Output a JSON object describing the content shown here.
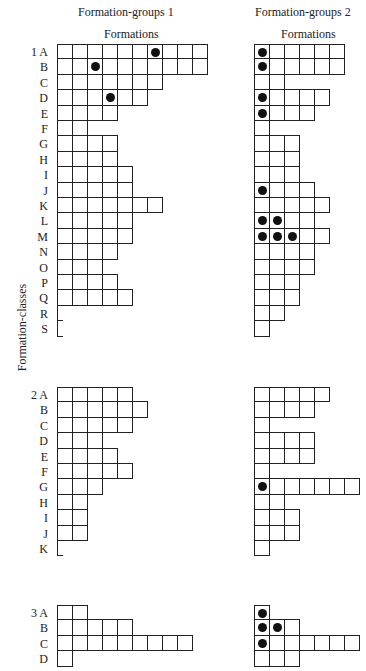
{
  "headers": {
    "group1": "Formation-groups 1",
    "group2": "Formation-groups 2",
    "sub1": "Formations",
    "sub2": "Formations",
    "yaxis": "Formation-classes"
  },
  "classes": [
    {
      "label": "1",
      "top": 44,
      "rows": [
        {
          "letter": "A",
          "g1": 10,
          "g1dots": [
            7
          ],
          "g2": 6,
          "g2dots": [
            1
          ]
        },
        {
          "letter": "B",
          "g1": 10,
          "g1dots": [
            3
          ],
          "g2": 6,
          "g2dots": [
            1
          ]
        },
        {
          "letter": "C",
          "g1": 7,
          "g1dots": [],
          "g2": 2,
          "g2dots": []
        },
        {
          "letter": "D",
          "g1": 6,
          "g1dots": [
            4
          ],
          "g2": 5,
          "g2dots": [
            1
          ]
        },
        {
          "letter": "E",
          "g1": 4,
          "g1dots": [],
          "g2": 4,
          "g2dots": [
            1
          ]
        },
        {
          "letter": "F",
          "g1": 2,
          "g1dots": [],
          "g2": 1,
          "g2dots": []
        },
        {
          "letter": "G",
          "g1": 4,
          "g1dots": [],
          "g2": 3,
          "g2dots": []
        },
        {
          "letter": "H",
          "g1": 4,
          "g1dots": [],
          "g2": 3,
          "g2dots": []
        },
        {
          "letter": "I",
          "g1": 5,
          "g1dots": [],
          "g2": 3,
          "g2dots": []
        },
        {
          "letter": "J",
          "g1": 5,
          "g1dots": [],
          "g2": 4,
          "g2dots": [
            1
          ]
        },
        {
          "letter": "K",
          "g1": 7,
          "g1dots": [],
          "g2": 5,
          "g2dots": []
        },
        {
          "letter": "L",
          "g1": 5,
          "g1dots": [],
          "g2": 4,
          "g2dots": [
            1,
            2
          ]
        },
        {
          "letter": "M",
          "g1": 5,
          "g1dots": [],
          "g2": 5,
          "g2dots": [
            1,
            2,
            3
          ]
        },
        {
          "letter": "N",
          "g1": 4,
          "g1dots": [],
          "g2": 4,
          "g2dots": []
        },
        {
          "letter": "O",
          "g1": 3,
          "g1dots": [],
          "g2": 4,
          "g2dots": []
        },
        {
          "letter": "P",
          "g1": 4,
          "g1dots": [],
          "g2": 3,
          "g2dots": []
        },
        {
          "letter": "Q",
          "g1": 5,
          "g1dots": [],
          "g2": 3,
          "g2dots": []
        },
        {
          "letter": "R",
          "g1": 0,
          "g1dots": [],
          "g2": 2,
          "g2dots": []
        },
        {
          "letter": "S",
          "g1": 0,
          "g1dots": [],
          "g2": 1,
          "g2dots": []
        }
      ]
    },
    {
      "label": "2",
      "top": 387,
      "rows": [
        {
          "letter": "A",
          "g1": 5,
          "g1dots": [],
          "g2": 5,
          "g2dots": []
        },
        {
          "letter": "B",
          "g1": 6,
          "g1dots": [],
          "g2": 4,
          "g2dots": []
        },
        {
          "letter": "C",
          "g1": 5,
          "g1dots": [],
          "g2": 1,
          "g2dots": []
        },
        {
          "letter": "D",
          "g1": 3,
          "g1dots": [],
          "g2": 4,
          "g2dots": []
        },
        {
          "letter": "E",
          "g1": 4,
          "g1dots": [],
          "g2": 4,
          "g2dots": []
        },
        {
          "letter": "F",
          "g1": 5,
          "g1dots": [],
          "g2": 1,
          "g2dots": []
        },
        {
          "letter": "G",
          "g1": 3,
          "g1dots": [],
          "g2": 7,
          "g2dots": [
            1
          ]
        },
        {
          "letter": "H",
          "g1": 2,
          "g1dots": [],
          "g2": 2,
          "g2dots": []
        },
        {
          "letter": "I",
          "g1": 2,
          "g1dots": [],
          "g2": 3,
          "g2dots": []
        },
        {
          "letter": "J",
          "g1": 2,
          "g1dots": [],
          "g2": 3,
          "g2dots": []
        },
        {
          "letter": "K",
          "g1": 0,
          "g1dots": [],
          "g2": 1,
          "g2dots": []
        }
      ]
    },
    {
      "label": "3",
      "top": 605,
      "rows": [
        {
          "letter": "A",
          "g1": 2,
          "g1dots": [],
          "g2": 1,
          "g2dots": [
            1
          ]
        },
        {
          "letter": "B",
          "g1": 5,
          "g1dots": [],
          "g2": 3,
          "g2dots": [
            1,
            2
          ]
        },
        {
          "letter": "C",
          "g1": 9,
          "g1dots": [],
          "g2": 7,
          "g2dots": [
            1
          ]
        },
        {
          "letter": "D",
          "g1": 1,
          "g1dots": [],
          "g2": 3,
          "g2dots": []
        }
      ]
    }
  ]
}
